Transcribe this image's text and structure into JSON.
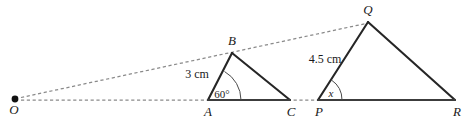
{
  "figure": {
    "type": "geometry-diagram",
    "background_color": "#ffffff",
    "stroke_color": "#262626",
    "dashed_color": "#8a8a8a",
    "vertices": {
      "O": {
        "label": "O",
        "x": 15,
        "y": 99,
        "label_x": 14,
        "label_y": 114,
        "dot": true
      },
      "A": {
        "label": "A",
        "x": 208,
        "y": 100,
        "label_x": 205,
        "label_y": 116
      },
      "B": {
        "label": "B",
        "x": 232,
        "y": 53,
        "label_x": 229,
        "label_y": 44
      },
      "C": {
        "label": "C",
        "x": 290,
        "y": 100,
        "label_x": 287,
        "label_y": 116
      },
      "P": {
        "label": "P",
        "x": 318,
        "y": 100,
        "label_x": 315,
        "label_y": 116
      },
      "Q": {
        "label": "Q",
        "x": 368,
        "y": 22,
        "label_x": 364,
        "label_y": 13
      },
      "R": {
        "label": "R",
        "x": 455,
        "y": 100,
        "label_x": 453,
        "label_y": 116
      }
    },
    "measurements": [
      {
        "name": "side-AB-length",
        "text": "3 cm",
        "x": 197,
        "y": 78,
        "refers_to": "AB"
      },
      {
        "name": "side-PQ-length",
        "text": "4.5 cm",
        "x": 325,
        "y": 63,
        "refers_to": "PQ"
      }
    ],
    "angles": [
      {
        "name": "angle-BAC",
        "text": "60°",
        "x": 222,
        "y": 98,
        "vertex": "A",
        "value": 60,
        "unit": "degrees",
        "italic": false
      },
      {
        "name": "angle-QPR",
        "text": "x",
        "x": 331,
        "y": 97,
        "vertex": "P",
        "value": null,
        "unit": "unknown",
        "italic": true
      }
    ],
    "solid_edges": [
      {
        "name": "edge-AB",
        "from": "A",
        "to": "B"
      },
      {
        "name": "edge-BC",
        "from": "B",
        "to": "C"
      },
      {
        "name": "edge-AC",
        "from": "A",
        "to": "C"
      },
      {
        "name": "edge-PQ",
        "from": "P",
        "to": "Q"
      },
      {
        "name": "edge-QR",
        "from": "Q",
        "to": "R"
      },
      {
        "name": "edge-PR",
        "from": "P",
        "to": "R"
      }
    ],
    "dashed_rays": [
      {
        "name": "ray-O-to-Q",
        "from": "O",
        "through": "B",
        "to": "Q"
      },
      {
        "name": "ray-O-to-R-baseline",
        "from": "O",
        "through": "A",
        "to": "P"
      }
    ]
  }
}
